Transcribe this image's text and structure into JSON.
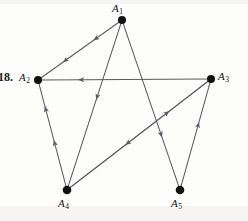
{
  "figure": {
    "problem_number": "18.",
    "type": "directed-graph",
    "background_color": "#fdfdfc",
    "edge_color": "#5a5a62",
    "vertex_color": "#111111",
    "label_color": "#121212",
    "width": 248,
    "height": 221,
    "vertices": [
      {
        "id": "A1",
        "label": "A",
        "subscript": "1",
        "x": 122,
        "y": 20,
        "label_x": 112,
        "label_y": 2,
        "radius": 4.0
      },
      {
        "id": "A2",
        "label": "A",
        "subscript": "2",
        "x": 38,
        "y": 80,
        "label_x": 19,
        "label_y": 71,
        "radius": 4.0
      },
      {
        "id": "A3",
        "label": "A",
        "subscript": "3",
        "x": 211,
        "y": 79,
        "label_x": 218,
        "label_y": 70,
        "radius": 4.0
      },
      {
        "id": "A4",
        "label": "A",
        "subscript": "4",
        "x": 67,
        "y": 190,
        "label_x": 58,
        "label_y": 197,
        "radius": 4.3
      },
      {
        "id": "A5",
        "label": "A",
        "subscript": "5",
        "x": 180,
        "y": 190,
        "label_x": 171,
        "label_y": 197,
        "radius": 4.3
      }
    ],
    "edges": [
      {
        "id": "e1",
        "from": "A1",
        "to": "A2",
        "arrow_positions": [
          0.33,
          0.72
        ],
        "note": "two arrowheads toward A2"
      },
      {
        "id": "e2",
        "from": "A3",
        "to": "A2",
        "arrow_positions": [
          0.78
        ],
        "note": "horizontal, arrow toward A2"
      },
      {
        "id": "e3",
        "from": "A4",
        "to": "A2",
        "arrow_positions": [
          0.45,
          0.78
        ],
        "note": "two arrowheads toward A2"
      },
      {
        "id": "e4",
        "from": "A1",
        "to": "A4",
        "arrow_positions": [
          0.47
        ],
        "note": "arrow toward A4"
      },
      {
        "id": "e5",
        "from": "A3",
        "to": "A4",
        "arrow_positions": [
          0.6
        ],
        "note": "long diagonal, arrow toward A4"
      },
      {
        "id": "e6",
        "from": "A4",
        "to": "A3",
        "arrow_positions": [
          0.72
        ],
        "note": "long diagonal, arrow toward A3"
      },
      {
        "id": "e7",
        "from": "A1",
        "to": "A5",
        "arrow_positions": [
          0.7
        ],
        "note": "arrow toward A5"
      },
      {
        "id": "e8",
        "from": "A5",
        "to": "A3",
        "arrow_positions": [
          0.62
        ],
        "note": "arrow toward A3"
      }
    ]
  }
}
